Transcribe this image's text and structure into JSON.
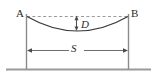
{
  "diagram": {
    "type": "engineering-line-diagram",
    "colors": {
      "curve": "#3a3a3a",
      "pole": "#8a8a8a",
      "dashed_chord": "#9a9a9a",
      "dimension_line": "#6e6e6e",
      "ground": "#9a9a9a",
      "label_text": "#2a2a2a",
      "background": "#ffffff"
    },
    "labels": {
      "support_left": "A",
      "support_right": "B",
      "sag": "D",
      "span": "S"
    },
    "elements": {
      "support_left_name": "left support pole at point A",
      "support_right_name": "right support pole at point B",
      "chord_name": "dashed straight reference line from A to B",
      "catenary_name": "sagging conductor curve between A and B",
      "sag_dimension_name": "vertical double arrow measuring sag D",
      "span_dimension_name": "horizontal double arrow measuring span S",
      "ground_name": "ground line"
    },
    "geometry": {
      "support_left_x": 26,
      "support_right_x": 128,
      "attachment_y": 16,
      "lowest_point_y": 31,
      "ground_y": 69,
      "span_dimension_y": 50,
      "sag_arrow_x": 76,
      "sag_top_y": 17,
      "sag_bottom_y": 29
    }
  }
}
